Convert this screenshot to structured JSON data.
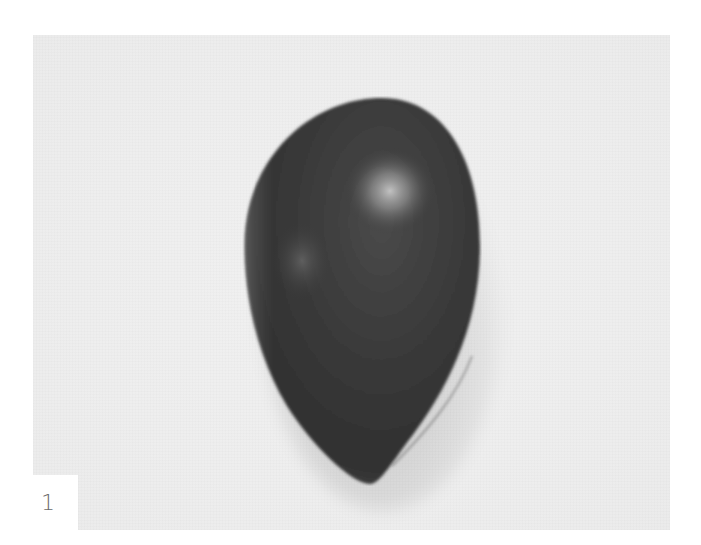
{
  "figure": {
    "label": "1",
    "background_color": "#eeeeee",
    "object_color": "#3a3a3a",
    "highlight_color": "#bdbdbd",
    "label_box_color": "#ffffff",
    "label_text_color": "#6a6a6a"
  }
}
